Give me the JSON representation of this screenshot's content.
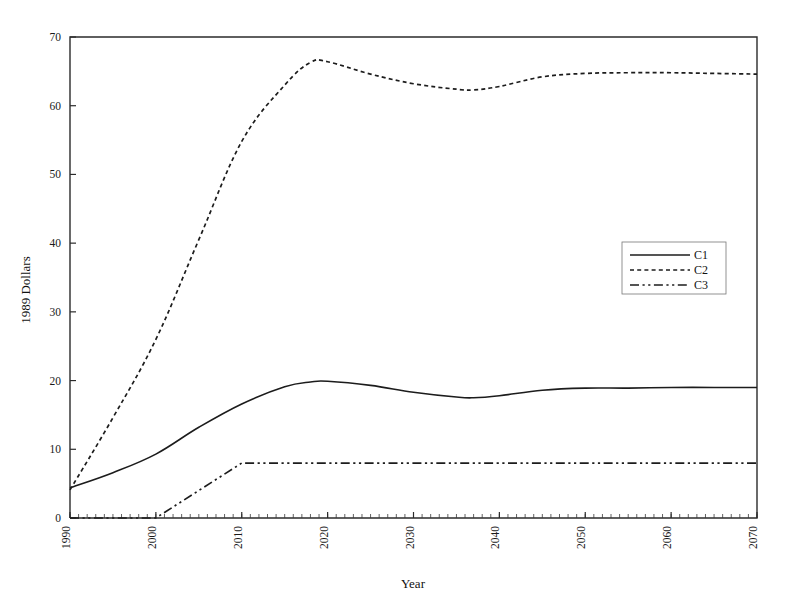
{
  "chart_data": {
    "type": "line",
    "title": "",
    "xlabel": "Year",
    "ylabel": "1989 Dollars",
    "xlim": [
      1990,
      2070
    ],
    "ylim": [
      0,
      70
    ],
    "xticks": [
      1990,
      2000,
      2010,
      2020,
      2030,
      2040,
      2050,
      2060,
      2070
    ],
    "xtick_labels": [
      "1990",
      "2000",
      "2010",
      "2020",
      "2030",
      "2040",
      "2050",
      "2060",
      "2070"
    ],
    "xtick_rotation": 90,
    "yticks": [
      0,
      10,
      20,
      30,
      40,
      50,
      60,
      70
    ],
    "ytick_labels": [
      "0",
      "10",
      "20",
      "30",
      "40",
      "50",
      "60",
      "70"
    ],
    "minor_xtick_interval": 1,
    "grid": false,
    "legend_position": "right-center",
    "x": [
      1990,
      1995,
      2000,
      2005,
      2010,
      2015,
      2018,
      2020,
      2025,
      2030,
      2035,
      2037,
      2040,
      2045,
      2050,
      2055,
      2060,
      2065,
      2070
    ],
    "series": [
      {
        "name": "C1",
        "style": "solid",
        "values": [
          4.4,
          6.6,
          9.3,
          13.2,
          16.6,
          19.1,
          19.8,
          19.9,
          19.3,
          18.3,
          17.6,
          17.5,
          17.8,
          18.6,
          18.9,
          18.9,
          19.0,
          19.0,
          19.0
        ]
      },
      {
        "name": "C2",
        "style": "dotted",
        "values": [
          4.1,
          14.6,
          26.0,
          40.5,
          54.8,
          63.0,
          66.3,
          66.4,
          64.6,
          63.2,
          62.4,
          62.3,
          62.8,
          64.2,
          64.7,
          64.8,
          64.8,
          64.7,
          64.6
        ]
      },
      {
        "name": "C3",
        "style": "dash-dot-dot",
        "values": [
          0.0,
          0.0,
          0.0,
          4.0,
          8.0,
          8.0,
          8.0,
          8.0,
          8.0,
          8.0,
          8.0,
          8.0,
          8.0,
          8.0,
          8.0,
          8.0,
          8.0,
          8.0,
          8.0
        ]
      }
    ],
    "legend_entries": [
      "C1",
      "C2",
      "C3"
    ],
    "colors": {
      "axis": "#2b2b2b",
      "series": "#1c1c1c",
      "background": "#ffffff"
    }
  }
}
